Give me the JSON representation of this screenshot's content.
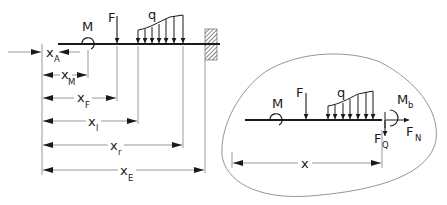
{
  "colors": {
    "ink": "#1a1a1a",
    "thin": "#555555",
    "outline": "#7a7a7a",
    "background": "#ffffff"
  },
  "left_diagram": {
    "title": "Beam with loads and coordinate dimensions",
    "labels": {
      "moment": "M",
      "force": "F",
      "distributed_load": "q"
    },
    "dimensions": [
      {
        "main": "x",
        "sub": "A"
      },
      {
        "main": "x",
        "sub": "M"
      },
      {
        "main": "x",
        "sub": "F"
      },
      {
        "main": "x",
        "sub": "l"
      },
      {
        "main": "x",
        "sub": "r"
      },
      {
        "main": "x",
        "sub": "E"
      }
    ],
    "support": "fixed-wall"
  },
  "right_diagram": {
    "title": "Free body cut-out",
    "labels": {
      "moment": "M",
      "force": "F",
      "distributed_load": "q",
      "bending_moment": {
        "main": "M",
        "sub": "b"
      },
      "shear_force": {
        "main": "F",
        "sub": "Q"
      },
      "normal_force": {
        "main": "F",
        "sub": "N"
      }
    },
    "dimension": {
      "main": "x"
    }
  }
}
